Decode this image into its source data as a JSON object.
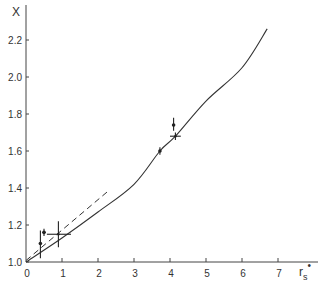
{
  "chart_data": {
    "type": "line",
    "title": "",
    "xlabel": "r_s*",
    "ylabel": "X",
    "xlim": [
      0,
      7.5
    ],
    "ylim": [
      1.0,
      2.35
    ],
    "x_ticks": [
      "0",
      "1",
      "2",
      "3",
      "4",
      "5",
      "6",
      "7"
    ],
    "y_ticks": [
      "1.0",
      "1.2",
      "1.4",
      "1.6",
      "1.8",
      "2.0",
      "2.2"
    ],
    "grid": false,
    "legend": null,
    "series": [
      {
        "name": "theory (solid)",
        "style": "solid",
        "x": [
          0,
          1,
          2,
          3,
          3.72,
          4.15,
          5,
          6,
          6.7
        ],
        "y": [
          1.0,
          1.13,
          1.27,
          1.42,
          1.6,
          1.68,
          1.87,
          2.05,
          2.26
        ]
      },
      {
        "name": "low-density approximation (dashed)",
        "style": "dashed",
        "x": [
          0,
          2.25
        ],
        "y": [
          1.0,
          1.37
        ]
      }
    ],
    "points": [
      {
        "x": 0.4,
        "y": 1.1,
        "yerr_low": 1.02,
        "yerr_high": 1.17,
        "xerr_low": null,
        "xerr_high": null,
        "marker": "dot"
      },
      {
        "x": 0.5,
        "y": 1.16,
        "yerr_low": 1.14,
        "yerr_high": 1.18,
        "xerr_low": 0.45,
        "xerr_high": 0.55,
        "marker": "dot"
      },
      {
        "x": 0.9,
        "y": 1.15,
        "yerr_low": 1.08,
        "yerr_high": 1.22,
        "xerr_low": 0.58,
        "xerr_high": 1.25,
        "marker": "cross"
      },
      {
        "x": 3.72,
        "y": 1.6,
        "yerr_low": 1.58,
        "yerr_high": 1.62,
        "xerr_low": null,
        "xerr_high": null,
        "marker": "dot"
      },
      {
        "x": 4.1,
        "y": 1.74,
        "yerr_low": 1.71,
        "yerr_high": 1.78,
        "xerr_low": null,
        "xerr_high": null,
        "marker": "dot"
      },
      {
        "x": 4.15,
        "y": 1.68,
        "yerr_low": 1.66,
        "yerr_high": 1.7,
        "xerr_low": 4.0,
        "xerr_high": 4.3,
        "marker": "cross"
      }
    ]
  },
  "labels": {
    "y_axis": "X",
    "x_axis_main": "r",
    "x_axis_sub": "s",
    "x_axis_sup": "•"
  }
}
